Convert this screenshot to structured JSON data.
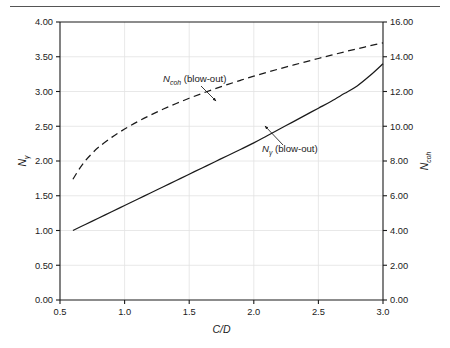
{
  "figure": {
    "top_rule": true,
    "background": "#ffffff",
    "axis_color": "#1a1a1a",
    "grid_color": "#e2e2e2",
    "curve_color": "#1a1a1a"
  },
  "chart_data": {
    "type": "line",
    "title": "",
    "xlabel": "C/D",
    "ylabel": "Nγ",
    "ylabel_right": "Ncoh",
    "grid": true,
    "legend_position": "inline-annotations",
    "xlim": [
      0.5,
      3.0
    ],
    "ylim": [
      0.0,
      4.0
    ],
    "ylim_right": [
      0.0,
      16.0
    ],
    "xticks": [
      "0.5",
      "1.0",
      "1.5",
      "2.0",
      "2.5",
      "3.0"
    ],
    "xtick_values": [
      0.5,
      1.0,
      1.5,
      2.0,
      2.5,
      3.0
    ],
    "yticks": [
      "0.00",
      "0.50",
      "1.00",
      "1.50",
      "2.00",
      "2.50",
      "3.00",
      "3.50",
      "4.00"
    ],
    "ytick_values": [
      0.0,
      0.5,
      1.0,
      1.5,
      2.0,
      2.5,
      3.0,
      3.5,
      4.0
    ],
    "yticks_right": [
      "0.00",
      "2.00",
      "4.00",
      "6.00",
      "8.00",
      "10.00",
      "12.00",
      "14.00",
      "16.00"
    ],
    "ytick_right_values": [
      0.0,
      2.0,
      4.0,
      6.0,
      8.0,
      10.0,
      12.0,
      14.0,
      16.0
    ],
    "series": [
      {
        "name": "Nγ (blow-out)",
        "style": "solid",
        "axis": "left",
        "x": [
          0.6,
          0.7,
          0.8,
          0.9,
          1.0,
          1.1,
          1.2,
          1.3,
          1.4,
          1.5,
          1.6,
          1.7,
          1.8,
          1.9,
          2.0,
          2.1,
          2.2,
          2.3,
          2.4,
          2.5,
          2.6,
          2.7,
          2.8,
          2.9,
          3.0
        ],
        "values": [
          1.0,
          1.09,
          1.18,
          1.27,
          1.36,
          1.45,
          1.54,
          1.63,
          1.72,
          1.81,
          1.9,
          1.99,
          2.08,
          2.17,
          2.26,
          2.36,
          2.46,
          2.56,
          2.66,
          2.76,
          2.86,
          2.97,
          3.08,
          3.23,
          3.4
        ]
      },
      {
        "name": "Ncoh (blow-out)",
        "style": "dashed",
        "axis": "right",
        "x": [
          0.6,
          0.65,
          0.7,
          0.75,
          0.8,
          0.9,
          1.0,
          1.1,
          1.2,
          1.3,
          1.4,
          1.5,
          1.6,
          1.7,
          1.8,
          1.9,
          2.0,
          2.1,
          2.2,
          2.3,
          2.4,
          2.5,
          2.6,
          2.7,
          2.8,
          2.9,
          3.0
        ],
        "values": [
          6.95,
          7.55,
          8.05,
          8.45,
          8.8,
          9.36,
          9.84,
          10.26,
          10.64,
          10.99,
          11.31,
          11.61,
          11.89,
          12.16,
          12.41,
          12.65,
          12.88,
          13.1,
          13.31,
          13.51,
          13.71,
          13.9,
          14.09,
          14.28,
          14.46,
          14.63,
          14.8
        ]
      }
    ],
    "annotations": [
      {
        "name": "ncoh-annotation",
        "symbol": "N",
        "subscript": "coh",
        "text": " (blow-out)",
        "full_text": "Ncoh (blow-out)",
        "label_x": 163,
        "label_y": 82,
        "leader_from": [
          201,
          86
        ],
        "leader_to": [
          216,
          101
        ]
      },
      {
        "name": "ngamma-annotation",
        "symbol": "N",
        "subscript": "γ",
        "text": " (blow-out)",
        "full_text": "Nγ (blow-out)",
        "label_x": 262,
        "label_y": 152,
        "leader_from": [
          283,
          145
        ],
        "leader_to": [
          265,
          126
        ]
      }
    ]
  }
}
